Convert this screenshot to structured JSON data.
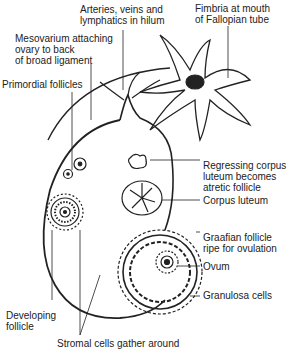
{
  "diagram": {
    "labels": {
      "arteries": [
        "Arteries, veins and",
        "lymphatics in hilum"
      ],
      "fimbria": [
        "Fimbria at mouth",
        "of Fallopian tube"
      ],
      "mesovarium": [
        "Mesovarium attaching",
        "ovary to back",
        "of broad ligament"
      ],
      "primordial": [
        "Primordial follicles"
      ],
      "regressing": [
        "Regressing corpus",
        "luteum becomes",
        "atretic follicle"
      ],
      "corpus_luteum": [
        "Corpus luteum"
      ],
      "graafian": [
        "Graafian follicle",
        "ripe for ovulation"
      ],
      "ovum": [
        "Ovum"
      ],
      "granulosa": [
        "Granulosa cells"
      ],
      "developing": [
        "Developing",
        "follicle"
      ],
      "stromal": [
        "Stromal cells gather around"
      ]
    }
  }
}
